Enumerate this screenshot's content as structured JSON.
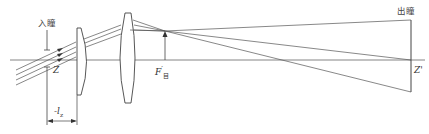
{
  "diagram": {
    "title": "",
    "labels": {
      "entrance_pupil": "入瞳",
      "exit_pupil": "出瞳",
      "entrance_point": "Z",
      "exit_point": "Z'",
      "focal_point_main": "F",
      "focal_point_prime": "′",
      "focal_point_sub": "目",
      "distance_main": "-l",
      "distance_sub": "z"
    },
    "colors": {
      "line": "#555555",
      "axis": "#666666",
      "text": "#333333"
    },
    "elements": [
      {
        "type": "optical-axis",
        "y": 60
      },
      {
        "type": "entrance-pupil",
        "x": 47
      },
      {
        "type": "lens",
        "shape": "plano-convex",
        "x": 77
      },
      {
        "type": "lens",
        "shape": "biconvex",
        "x": 127
      },
      {
        "type": "focal-arrow",
        "x": 165
      },
      {
        "type": "exit-pupil",
        "x": 411
      }
    ]
  }
}
